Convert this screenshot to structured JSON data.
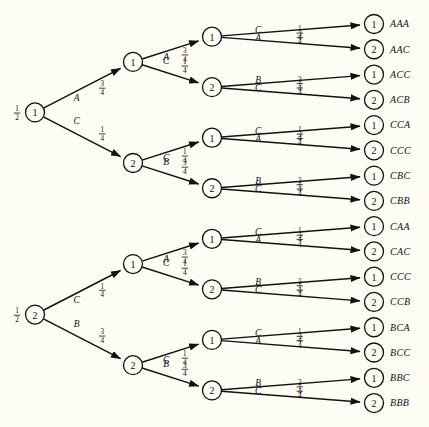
{
  "diagram": {
    "type": "probability-tree",
    "background_color": "#fdfdf3",
    "stroke_color": "#111111",
    "depth": 3,
    "leaf_count": 16
  },
  "roots": [
    {
      "id": "r1",
      "label": "1",
      "prob_numerator": "1",
      "prob_denominator": "2",
      "prob_text": "1/2"
    },
    {
      "id": "r2",
      "label": "2",
      "prob_numerator": "1",
      "prob_denominator": "2",
      "prob_text": "1/2"
    }
  ],
  "level1": [
    {
      "id": "n1",
      "label": "1",
      "letter": "A",
      "num": "3",
      "den": "4"
    },
    {
      "id": "n2",
      "label": "2",
      "letter": "C",
      "num": "1",
      "den": "4"
    },
    {
      "id": "n3",
      "label": "1",
      "letter": "C",
      "num": "1",
      "den": "4"
    },
    {
      "id": "n4",
      "label": "2",
      "letter": "B",
      "num": "3",
      "den": "4"
    }
  ],
  "level2": [
    {
      "id": "m1",
      "label": "1",
      "letter": "A",
      "num": "3",
      "den": "4"
    },
    {
      "id": "m2",
      "label": "2",
      "letter": "C",
      "num": "1",
      "den": "4"
    },
    {
      "id": "m3",
      "label": "1",
      "letter": "C",
      "num": "1",
      "den": "4"
    },
    {
      "id": "m4",
      "label": "2",
      "letter": "B",
      "num": "3",
      "den": "4"
    },
    {
      "id": "m5",
      "label": "1",
      "letter": "A",
      "num": "3",
      "den": "4"
    },
    {
      "id": "m6",
      "label": "2",
      "letter": "C",
      "num": "1",
      "den": "4"
    },
    {
      "id": "m7",
      "label": "1",
      "letter": "C",
      "num": "1",
      "den": "4"
    },
    {
      "id": "m8",
      "label": "2",
      "letter": "B",
      "num": "3",
      "den": "4"
    }
  ],
  "leaves": [
    {
      "id": "l1",
      "label": "1",
      "word": "AAA",
      "letter": "A",
      "num": "3",
      "den": "4"
    },
    {
      "id": "l2",
      "label": "2",
      "word": "AAC",
      "letter": "C",
      "num": "1",
      "den": "4"
    },
    {
      "id": "l3",
      "label": "1",
      "word": "ACC",
      "letter": "C",
      "num": "1",
      "den": "4"
    },
    {
      "id": "l4",
      "label": "2",
      "word": "ACB",
      "letter": "B",
      "num": "3",
      "den": "4"
    },
    {
      "id": "l5",
      "label": "1",
      "word": "CCA",
      "letter": "A",
      "num": "3",
      "den": "4"
    },
    {
      "id": "l6",
      "label": "2",
      "word": "CCC",
      "letter": "C",
      "num": "1",
      "den": "4"
    },
    {
      "id": "l7",
      "label": "1",
      "word": "CBC",
      "letter": "C",
      "num": "1",
      "den": "4"
    },
    {
      "id": "l8",
      "label": "2",
      "word": "CBB",
      "letter": "B",
      "num": "3",
      "den": "4"
    },
    {
      "id": "l9",
      "label": "1",
      "word": "CAA",
      "letter": "A",
      "num": "3",
      "den": "4"
    },
    {
      "id": "l10",
      "label": "2",
      "word": "CAC",
      "letter": "C",
      "num": "1",
      "den": "4"
    },
    {
      "id": "l11",
      "label": "1",
      "word": "CCC",
      "letter": "C",
      "num": "1",
      "den": "4"
    },
    {
      "id": "l12",
      "label": "2",
      "word": "CCB",
      "letter": "B",
      "num": "3",
      "den": "4"
    },
    {
      "id": "l13",
      "label": "1",
      "word": "BCA",
      "letter": "A",
      "num": "3",
      "den": "4"
    },
    {
      "id": "l14",
      "label": "2",
      "word": "BCC",
      "letter": "C",
      "num": "1",
      "den": "4"
    },
    {
      "id": "l15",
      "label": "1",
      "word": "BBC",
      "letter": "C",
      "num": "1",
      "den": "4"
    },
    {
      "id": "l16",
      "label": "2",
      "word": "BBB",
      "letter": "B",
      "num": "3",
      "den": "4"
    }
  ]
}
